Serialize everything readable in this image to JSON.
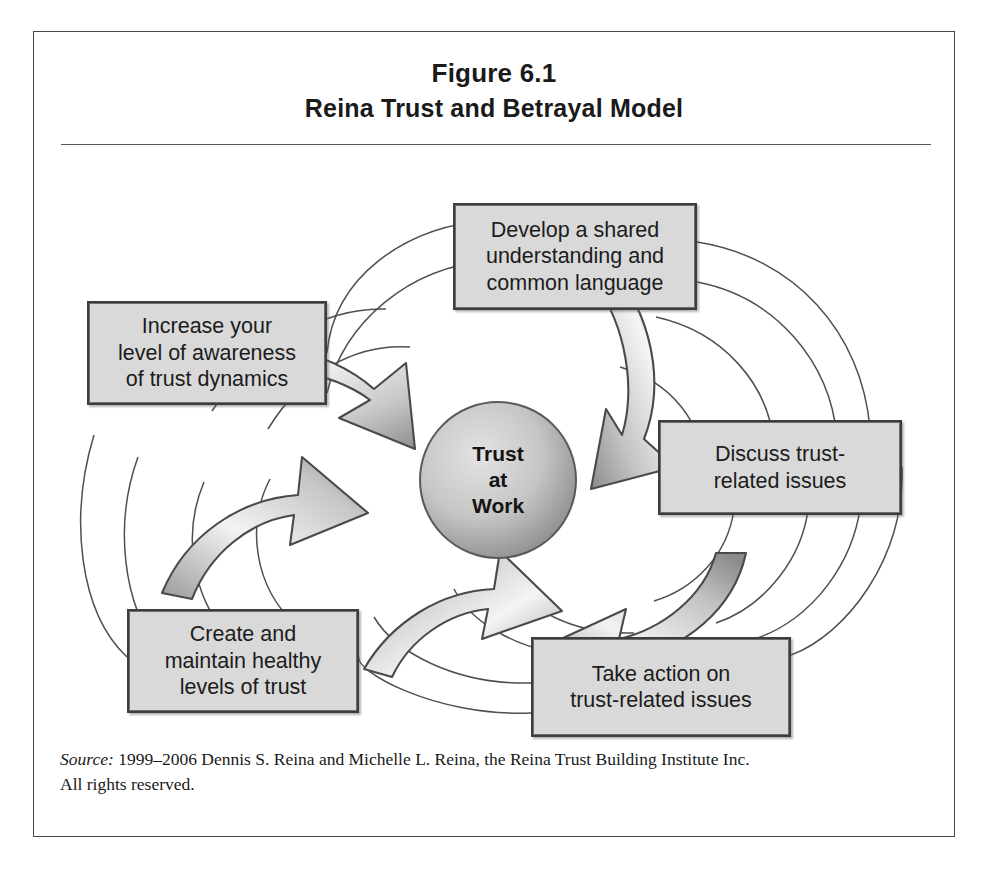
{
  "figure": {
    "number": "Figure 6.1",
    "title": "Reina Trust and Betrayal Model"
  },
  "center": {
    "line1": "Trust",
    "line2": "at",
    "line3": "Work"
  },
  "boxes": [
    {
      "id": "develop",
      "text": "Develop a shared\nunderstanding and\ncommon language"
    },
    {
      "id": "discuss",
      "text": "Discuss trust-\nrelated issues"
    },
    {
      "id": "take",
      "text": "Take action on\ntrust-related issues"
    },
    {
      "id": "create",
      "text": "Create and\nmaintain healthy\nlevels of trust"
    },
    {
      "id": "increase",
      "text": "Increase your\nlevel of awareness\nof trust dynamics"
    }
  ],
  "source": {
    "label": "Source:",
    "line1": " 1999–2006 Dennis S. Reina and Michelle L. Reina, the Reina Trust Building Institute Inc.",
    "line2": "All rights reserved."
  },
  "colors": {
    "frame_border": "#4a4a4a",
    "box_fill": "#d9d9d9",
    "box_border": "#3d3d3d",
    "arrow_light": "#f2f2f2",
    "arrow_dark": "#9a9a9a",
    "circle_light": "#dcdcdc",
    "circle_dark": "#8f8f8f",
    "text": "#1a1a1a"
  }
}
